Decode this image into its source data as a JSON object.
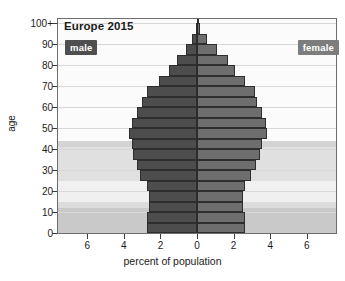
{
  "title": "Europe 2015",
  "legend": {
    "male_label": "male",
    "female_label": "female",
    "male_color": "#4d4d4d",
    "female_color": "#6e6e6e"
  },
  "axes": {
    "ylabel": "age",
    "xlabel": "percent of population",
    "yticks": [
      "0",
      "10",
      "20",
      "30",
      "40",
      "50",
      "60",
      "70",
      "80",
      "90",
      "100+"
    ],
    "xticks": [
      "6",
      "4",
      "2",
      "0",
      "2",
      "4",
      "6"
    ]
  },
  "chart_data": {
    "type": "bar",
    "subtype": "population-pyramid",
    "title": "Europe 2015",
    "xlabel": "percent of population",
    "ylabel": "age",
    "xlim": [
      -7.6,
      7.6
    ],
    "ylim": [
      0,
      102
    ],
    "xticks": [
      -6,
      -4,
      -2,
      0,
      2,
      4,
      6
    ],
    "xticklabels": [
      "6",
      "4",
      "2",
      "0",
      "2",
      "4",
      "6"
    ],
    "yticks": [
      0,
      10,
      20,
      30,
      40,
      50,
      60,
      70,
      80,
      90,
      100
    ],
    "yticklabels": [
      "0",
      "10",
      "20",
      "30",
      "40",
      "50",
      "60",
      "70",
      "80",
      "90",
      "100+"
    ],
    "grid": true,
    "legend_position": "inside-top-corners",
    "categories": [
      "0-4",
      "5-9",
      "10-14",
      "15-19",
      "20-24",
      "25-29",
      "30-34",
      "35-39",
      "40-44",
      "45-49",
      "50-54",
      "55-59",
      "60-64",
      "65-69",
      "70-74",
      "75-79",
      "80-84",
      "85-89",
      "90-94",
      "95-99",
      "100+"
    ],
    "age_starts": [
      0,
      5,
      10,
      15,
      20,
      25,
      30,
      35,
      40,
      45,
      50,
      55,
      60,
      65,
      70,
      75,
      80,
      85,
      90,
      95,
      100
    ],
    "series": [
      {
        "name": "male",
        "color": "#4d4d4d",
        "side": "left",
        "values": [
          2.75,
          2.75,
          2.65,
          2.65,
          2.75,
          3.1,
          3.3,
          3.5,
          3.55,
          3.7,
          3.55,
          3.3,
          3.0,
          2.75,
          2.1,
          1.55,
          1.1,
          0.6,
          0.25,
          0.07,
          0.02
        ]
      },
      {
        "name": "female",
        "color": "#6e6e6e",
        "side": "right",
        "values": [
          2.6,
          2.6,
          2.5,
          2.5,
          2.6,
          2.95,
          3.2,
          3.45,
          3.55,
          3.8,
          3.75,
          3.55,
          3.3,
          3.15,
          2.6,
          2.1,
          1.7,
          1.1,
          0.55,
          0.16,
          0.04
        ]
      }
    ],
    "bands": [
      {
        "from": 0,
        "to": 12,
        "shade": "#c9c9c9"
      },
      {
        "from": 12,
        "to": 15,
        "shade": "#dcdcdc"
      },
      {
        "from": 15,
        "to": 25,
        "shade": "#f0f0f0"
      },
      {
        "from": 25,
        "to": 41,
        "shade": "#e0e0e0"
      },
      {
        "from": 41,
        "to": 44,
        "shade": "#d4d4d4"
      },
      {
        "from": 44,
        "to": 102,
        "shade": "#fbfbfb"
      }
    ]
  }
}
